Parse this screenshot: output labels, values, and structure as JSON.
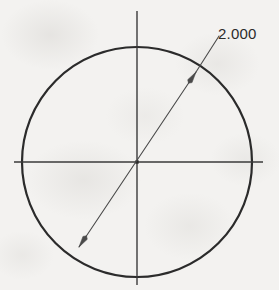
{
  "drawing": {
    "title": "Circle with diameter dimension",
    "units_implied": "inches",
    "background_color": "#f2f1ef",
    "line_color": "#2b2b2b",
    "thin_line_color": "#4a4a4a",
    "canvas": {
      "width": 279,
      "height": 290
    },
    "dimension": {
      "label": "2.000",
      "label_x": 218,
      "label_y": 39,
      "type": "diameter",
      "value": 2.0,
      "decimals": 3
    },
    "circle": {
      "center_x": 137,
      "center_y": 162,
      "radius": 115,
      "stroke_width": 2.2
    },
    "center_mark": {
      "horizontal": {
        "x1": 14,
        "y1": 162,
        "x2": 263,
        "y2": 162
      },
      "vertical": {
        "x1": 137,
        "y1": 11,
        "x2": 137,
        "y2": 285
      },
      "stroke_width": 1.4,
      "dot_size": 3.4
    },
    "dimension_line": {
      "start_x": 79,
      "start_y": 247,
      "end_x": 196,
      "end_y": 72,
      "leader_end_x": 219,
      "leader_end_y": 36,
      "stroke_width": 1.1
    },
    "arrowheads": [
      {
        "name": "arrowhead-lower-left",
        "tip_x": 79,
        "tip_y": 247,
        "angle_deg": 236
      },
      {
        "name": "arrowhead-upper-right",
        "tip_x": 196,
        "tip_y": 72,
        "angle_deg": 56
      }
    ]
  }
}
